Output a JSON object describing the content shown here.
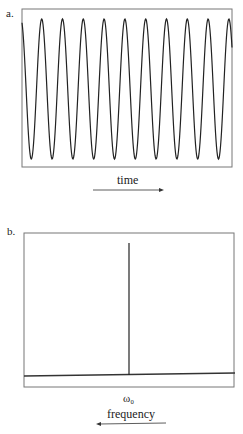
{
  "panel_a": {
    "label": "a.",
    "axis_label": "time",
    "arrow_direction": "right",
    "signal": {
      "type": "sinusoid",
      "cycles_visible": 10,
      "period_px": 20.8
    }
  },
  "panel_b": {
    "label": "b.",
    "peak_label": "ω₀",
    "axis_label": "frequency",
    "arrow_direction": "left"
  },
  "colors": {
    "line": "#222222",
    "frame": "#777777",
    "background": "#ffffff"
  },
  "chart_data": [
    {
      "type": "line",
      "title": "a.",
      "xlabel": "time",
      "ylabel": "",
      "description": "Pure single-frequency sinusoid with ~10 full cycles across the window",
      "series": [
        {
          "name": "signal",
          "frequency": "ω₀",
          "cycles": 10,
          "amplitude": 1
        }
      ]
    },
    {
      "type": "bar",
      "title": "b.",
      "xlabel": "frequency",
      "ylabel": "",
      "description": "Frequency spectrum: a single spike at ω₀",
      "categories": [
        "ω₀"
      ],
      "values": [
        1
      ]
    }
  ]
}
